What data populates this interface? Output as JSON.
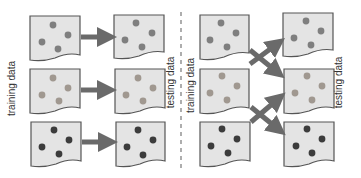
{
  "colors": {
    "panel_fill": "#e4e4e4",
    "panel_stroke": "#555555",
    "arrow": "#6a6a6a",
    "divider": "#9a9a9a",
    "dot_row1": "#7f7f7f",
    "dot_row2": "#a09890",
    "dot_row3": "#3c3c3c"
  },
  "left_panel": {
    "source_label": "training data",
    "target_label": "testing data",
    "mapping": "straight"
  },
  "right_panel": {
    "source_label": "training data",
    "target_label": "testing data",
    "mapping": "crossed"
  }
}
